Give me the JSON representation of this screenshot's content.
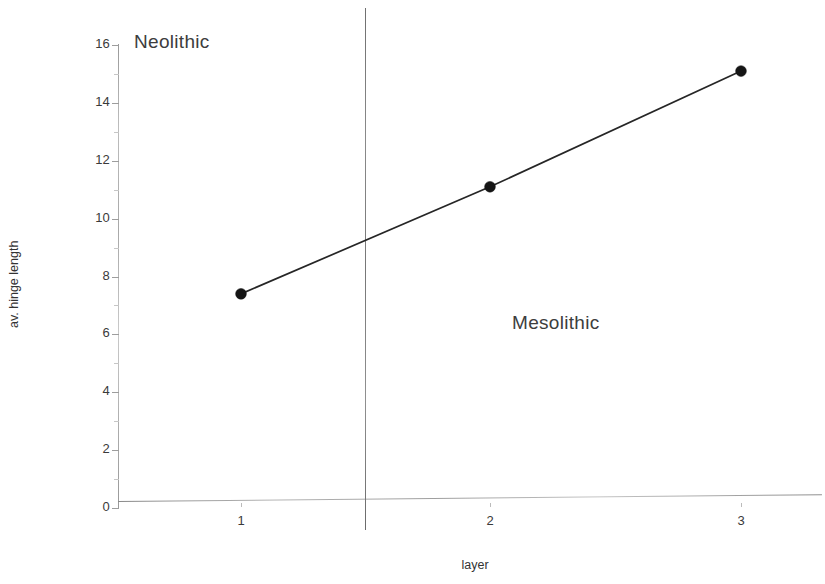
{
  "chart_data": {
    "type": "line",
    "title": "",
    "xlabel": "layer",
    "ylabel": "av. hinge length",
    "x": [
      1,
      2,
      3
    ],
    "categories": [
      "1",
      "2",
      "3"
    ],
    "values": [
      7.4,
      11.1,
      15.1
    ],
    "series": [
      {
        "name": "av. hinge length",
        "values": [
          7.4,
          11.1,
          15.1
        ]
      }
    ],
    "xlim": [
      0.55,
      3.45
    ],
    "ylim": [
      0,
      16
    ],
    "y_ticks": [
      0,
      2,
      4,
      6,
      8,
      10,
      12,
      14,
      16
    ],
    "y_tick_labels": [
      "0",
      "2",
      "4",
      "6",
      "8",
      "10",
      "12",
      "14",
      "16"
    ],
    "x_ticks": [
      1,
      2,
      3
    ],
    "x_tick_labels": [
      "1",
      "2",
      "3"
    ],
    "grid": false,
    "legend": "none",
    "marker": "filled-circle",
    "line_color": "#262626",
    "marker_color": "#151515",
    "axis_color": "#9d9d9d",
    "annotations": [
      {
        "text": "Neolithic",
        "region": "left",
        "x": 0.9,
        "y": 15.7
      },
      {
        "text": "Mesolithic",
        "region": "right",
        "x": 2.1,
        "y": 6.6
      }
    ],
    "dividers": [
      {
        "orientation": "vertical",
        "x": 1.5,
        "label": "period-boundary"
      }
    ]
  },
  "axes": {
    "y_title": "av. hinge length",
    "x_title": "layer"
  },
  "annotations": {
    "neolithic": "Neolithic",
    "mesolithic": "Mesolithic"
  }
}
